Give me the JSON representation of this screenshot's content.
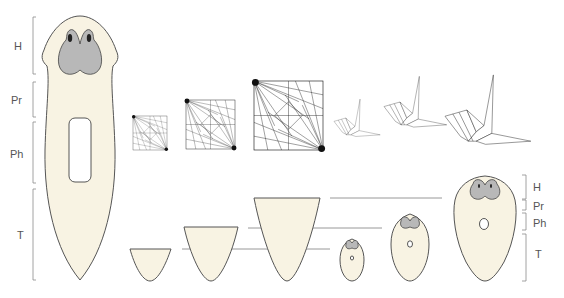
{
  "figure": {
    "left_worm": {
      "region_labels": [
        "H",
        "Pr",
        "Ph",
        "T"
      ]
    },
    "right_worm": {
      "region_labels": [
        "H",
        "Pr",
        "Ph",
        "T"
      ]
    },
    "crease_patterns": {
      "count": 3
    },
    "cranes": {
      "count": 3
    },
    "tail_fragments": {
      "count": 3
    },
    "regenerated_worms": {
      "count": 3
    },
    "colors": {
      "body": "#f8f3e3",
      "head": "#b8b8b8",
      "outline": "#555555",
      "guide_line": "#8c8c8c",
      "label": "#555555"
    }
  }
}
